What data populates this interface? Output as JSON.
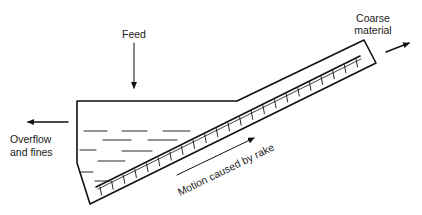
{
  "diagram": {
    "labels": {
      "feed": "Feed",
      "coarse_line1": "Coarse",
      "coarse_line2": "material",
      "overflow_line1": "Overflow",
      "overflow_line2": "and fines",
      "motion": "Motion caused by rake"
    },
    "colors": {
      "line": "#111111",
      "background": "#ffffff",
      "text": "#1a1a1a"
    },
    "components": [
      "tank",
      "inclined trough",
      "rake",
      "liquid pool",
      "feed inlet",
      "overflow outlet",
      "coarse discharge"
    ]
  }
}
